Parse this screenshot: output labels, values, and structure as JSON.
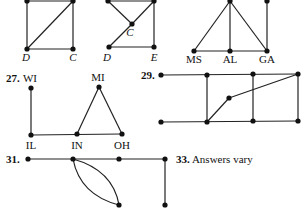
{
  "graphs": [
    {
      "id": "top-left-square",
      "labels": [
        {
          "text": "D",
          "x": 26,
          "y": 61,
          "italic": true
        },
        {
          "text": "C",
          "x": 73,
          "y": 61,
          "italic": true
        }
      ],
      "vertices": [
        [
          27,
          1
        ],
        [
          73,
          1
        ],
        [
          27,
          49
        ],
        [
          73,
          49
        ]
      ],
      "edges": [
        [
          [
            27,
            1
          ],
          [
            73,
            1
          ]
        ],
        [
          [
            27,
            1
          ],
          [
            27,
            49
          ]
        ],
        [
          [
            73,
            1
          ],
          [
            73,
            49
          ]
        ],
        [
          [
            27,
            49
          ],
          [
            73,
            49
          ]
        ],
        [
          [
            27,
            49
          ],
          [
            73,
            1
          ]
        ]
      ]
    },
    {
      "id": "top-middle",
      "labels": [
        {
          "text": "C",
          "x": 130,
          "y": 36,
          "italic": true
        },
        {
          "text": "D",
          "x": 107,
          "y": 61,
          "italic": true
        },
        {
          "text": "E",
          "x": 154,
          "y": 61,
          "italic": true
        }
      ],
      "vertices": [
        [
          108,
          1
        ],
        [
          154,
          1
        ],
        [
          132,
          24
        ],
        [
          109,
          47
        ],
        [
          154,
          47
        ]
      ],
      "edges": [
        [
          [
            108,
            1
          ],
          [
            154,
            1
          ]
        ],
        [
          [
            108,
            1
          ],
          [
            132,
            24
          ]
        ],
        [
          [
            154,
            1
          ],
          [
            132,
            24
          ]
        ],
        [
          [
            132,
            24
          ],
          [
            109,
            47
          ]
        ],
        [
          [
            154,
            1
          ],
          [
            154,
            47
          ]
        ],
        [
          [
            109,
            47
          ],
          [
            154,
            47
          ]
        ]
      ]
    },
    {
      "id": "top-right",
      "labels": [
        {
          "text": "MS",
          "x": 194,
          "y": 63
        },
        {
          "text": "AL",
          "x": 230,
          "y": 63
        },
        {
          "text": "GA",
          "x": 267,
          "y": 63
        }
      ],
      "vertices": [
        [
          230,
          1
        ],
        [
          267,
          1
        ],
        [
          194,
          51
        ],
        [
          230,
          51
        ],
        [
          267,
          51
        ]
      ],
      "edges": [
        [
          [
            230,
            1
          ],
          [
            194,
            51
          ]
        ],
        [
          [
            230,
            1
          ],
          [
            230,
            51
          ]
        ],
        [
          [
            230,
            1
          ],
          [
            267,
            51
          ]
        ],
        [
          [
            267,
            1
          ],
          [
            267,
            51
          ]
        ],
        [
          [
            194,
            51
          ],
          [
            267,
            51
          ]
        ]
      ]
    },
    {
      "id": "problem-27",
      "number": "27.",
      "number_pos": [
        6,
        82
      ],
      "labels": [
        {
          "text": "WI",
          "x": 30,
          "y": 82
        },
        {
          "text": "MI",
          "x": 98,
          "y": 81
        },
        {
          "text": "IL",
          "x": 31,
          "y": 149
        },
        {
          "text": "IN",
          "x": 77,
          "y": 149
        },
        {
          "text": "OH",
          "x": 122,
          "y": 149
        }
      ],
      "vertices": [
        [
          31,
          88
        ],
        [
          99,
          87
        ],
        [
          31,
          135
        ],
        [
          77,
          134
        ],
        [
          122,
          134
        ]
      ],
      "edges": [
        [
          [
            31,
            88
          ],
          [
            31,
            135
          ]
        ],
        [
          [
            31,
            135
          ],
          [
            122,
            134
          ]
        ],
        [
          [
            77,
            134
          ],
          [
            99,
            87
          ]
        ],
        [
          [
            99,
            87
          ],
          [
            122,
            134
          ]
        ]
      ]
    },
    {
      "id": "problem-29",
      "number": "29.",
      "number_pos": [
        141,
        79
      ],
      "labels": [],
      "vertices": [
        [
          161,
          75
        ],
        [
          207,
          75
        ],
        [
          253,
          74
        ],
        [
          298,
          74
        ],
        [
          229,
          98
        ],
        [
          161,
          122
        ],
        [
          207,
          122
        ],
        [
          253,
          121
        ],
        [
          298,
          121
        ]
      ],
      "edges": [
        [
          [
            161,
            75
          ],
          [
            298,
            74
          ]
        ],
        [
          [
            207,
            75
          ],
          [
            207,
            122
          ]
        ],
        [
          [
            253,
            74
          ],
          [
            253,
            121
          ]
        ],
        [
          [
            298,
            74
          ],
          [
            298,
            121
          ]
        ],
        [
          [
            161,
            122
          ],
          [
            298,
            121
          ]
        ],
        [
          [
            207,
            122
          ],
          [
            229,
            98
          ]
        ],
        [
          [
            229,
            98
          ],
          [
            298,
            74
          ]
        ]
      ]
    },
    {
      "id": "problem-31",
      "number": "31.",
      "number_pos": [
        6,
        163
      ],
      "labels": [],
      "vertices": [
        [
          28,
          159
        ],
        [
          73,
          159
        ],
        [
          119,
          159
        ],
        [
          165,
          159
        ],
        [
          119,
          205
        ],
        [
          165,
          205
        ]
      ],
      "edges": [
        [
          [
            28,
            159
          ],
          [
            165,
            159
          ]
        ],
        [
          [
            165,
            159
          ],
          [
            165,
            205
          ]
        ]
      ],
      "curves": [
        "M73,159 Q80,195 119,205",
        "M73,159 Q113,170 119,205"
      ]
    }
  ],
  "answer_33": {
    "number": "33.",
    "text": "Answers vary",
    "x": 176,
    "y": 163
  }
}
